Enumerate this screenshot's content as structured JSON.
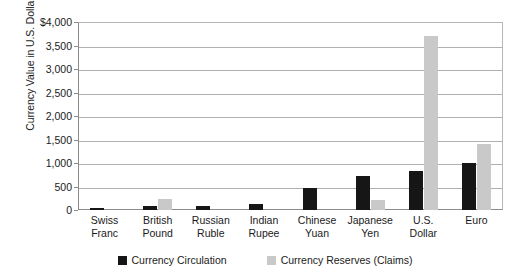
{
  "chart_data": {
    "type": "bar",
    "title": "",
    "xlabel": "",
    "ylabel": "Currency Value in U.S. Dollars (billions)",
    "ylim": [
      0,
      4000
    ],
    "ytick_labels": [
      "$4,000",
      "3,500",
      "3,000",
      "2,500",
      "2,000",
      "1,500",
      "1,000",
      "500",
      "0"
    ],
    "ytick_values": [
      4000,
      3500,
      3000,
      2500,
      2000,
      1500,
      1000,
      500,
      0
    ],
    "grid": true,
    "legend_position": "bottom",
    "categories": [
      "Swiss Franc",
      "British Pound",
      "Russian Ruble",
      "Indian Rupee",
      "Chinese Yuan",
      "Japanese Yen",
      "U.S. Dollar",
      "Euro"
    ],
    "category_lines": [
      [
        "Swiss",
        "Franc"
      ],
      [
        "British",
        "Pound"
      ],
      [
        "Russian",
        "Ruble"
      ],
      [
        "Indian",
        "Rupee"
      ],
      [
        "Chinese",
        "Yuan"
      ],
      [
        "Japanese",
        "Yen"
      ],
      [
        "U.S.",
        "Dollar"
      ],
      [
        "Euro",
        ""
      ]
    ],
    "series": [
      {
        "name": "Currency Circulation",
        "color": "#161616",
        "values": [
          50,
          90,
          80,
          120,
          470,
          720,
          820,
          990
        ]
      },
      {
        "name": "Currency Reserves (Claims)",
        "color": "#c9c9c9",
        "values": [
          0,
          230,
          0,
          0,
          0,
          210,
          3700,
          1400
        ]
      }
    ]
  },
  "legend": {
    "items": [
      {
        "label": "Currency Circulation",
        "swatch": "black-square-swatch"
      },
      {
        "label": "Currency Reserves (Claims)",
        "swatch": "gray-square-swatch"
      }
    ]
  }
}
